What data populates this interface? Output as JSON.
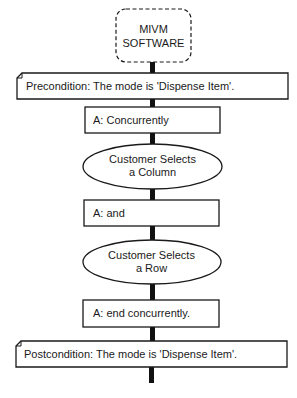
{
  "diagram": {
    "type": "activity-flow",
    "system": {
      "line1": "MIVM",
      "line2": "SOFTWARE"
    },
    "precondition": "Precondition: The mode is 'Dispense Item'.",
    "steps": [
      {
        "kind": "action",
        "text": "A:  Concurrently"
      },
      {
        "kind": "activity",
        "line1": "Customer Selects",
        "line2": "a Column"
      },
      {
        "kind": "action",
        "text": "A:  and"
      },
      {
        "kind": "activity",
        "line1": "Customer Selects",
        "line2": "a Row"
      },
      {
        "kind": "action",
        "text": "A:  end concurrently."
      }
    ],
    "postcondition": "Postcondition: The mode is 'Dispense Item'.",
    "colors": {
      "stroke": "#1a1a1a",
      "background": "#ffffff",
      "connector": "#111111"
    }
  }
}
